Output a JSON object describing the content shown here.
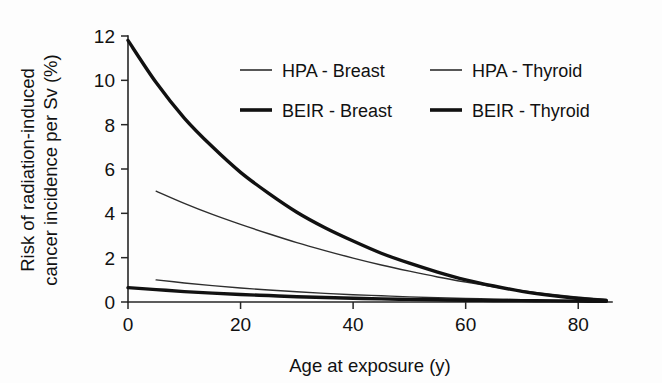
{
  "chart_data": {
    "type": "line",
    "title": "",
    "xlabel": "Age at exposure (y)",
    "ylabel": "Risk of radiation-induced cancer incidence per Sv (%)",
    "ylabel_line1": "Risk of radiation-induced",
    "ylabel_line2": "cancer incidence per Sv (%)",
    "xlim": [
      0,
      86
    ],
    "ylim": [
      0,
      12
    ],
    "xticks": [
      0,
      20,
      40,
      60,
      80
    ],
    "xtick_labels": [
      "0",
      "20",
      "40",
      "60",
      "80"
    ],
    "yticks": [
      0,
      2,
      4,
      6,
      8,
      10,
      12
    ],
    "ytick_labels": [
      "0",
      "2",
      "4",
      "6",
      "8",
      "10",
      "12"
    ],
    "grid": false,
    "legend_position": "upper-center",
    "x": [
      0,
      5,
      10,
      15,
      20,
      25,
      30,
      35,
      40,
      45,
      50,
      55,
      60,
      65,
      70,
      75,
      80,
      85
    ],
    "series": [
      {
        "name": "HPA - Breast",
        "line_width": "thin",
        "color": "#2e2e2e",
        "x": [
          5,
          10,
          15,
          20,
          25,
          30,
          35,
          40,
          45,
          50,
          55,
          60,
          65,
          70,
          75,
          80,
          85
        ],
        "values": [
          1.0,
          0.86,
          0.74,
          0.63,
          0.54,
          0.46,
          0.39,
          0.33,
          0.28,
          0.23,
          0.19,
          0.16,
          0.13,
          0.1,
          0.08,
          0.06,
          0.05
        ]
      },
      {
        "name": "HPA - Thyroid",
        "line_width": "thin",
        "color": "#2e2e2e",
        "x": [
          5,
          10,
          15,
          20,
          25,
          30,
          35,
          40,
          45,
          50,
          55,
          60,
          65,
          70,
          75,
          80,
          85
        ],
        "values": [
          5.0,
          4.45,
          3.95,
          3.5,
          3.08,
          2.68,
          2.32,
          1.98,
          1.67,
          1.39,
          1.13,
          0.9,
          0.69,
          0.51,
          0.35,
          0.22,
          0.12
        ]
      },
      {
        "name": "BEIR - Breast",
        "line_width": "thick",
        "color": "#111111",
        "x": [
          0,
          5,
          10,
          15,
          20,
          25,
          30,
          35,
          40,
          45,
          50,
          55,
          60,
          65,
          70,
          75,
          80,
          85
        ],
        "values": [
          0.65,
          0.56,
          0.47,
          0.4,
          0.34,
          0.29,
          0.24,
          0.2,
          0.17,
          0.14,
          0.12,
          0.1,
          0.08,
          0.07,
          0.06,
          0.05,
          0.04,
          0.03
        ]
      },
      {
        "name": "BEIR - Thyroid",
        "line_width": "thick",
        "color": "#111111",
        "x": [
          0,
          5,
          10,
          15,
          20,
          25,
          30,
          35,
          40,
          45,
          50,
          55,
          60,
          65,
          70,
          75,
          80,
          85
        ],
        "values": [
          11.8,
          9.9,
          8.3,
          7.0,
          5.85,
          4.9,
          4.05,
          3.35,
          2.75,
          2.2,
          1.75,
          1.35,
          1.0,
          0.72,
          0.48,
          0.3,
          0.16,
          0.07
        ]
      }
    ]
  },
  "legend": {
    "entries": [
      {
        "label": "HPA - Breast",
        "style": "thin"
      },
      {
        "label": "HPA - Thyroid",
        "style": "thin"
      },
      {
        "label": "BEIR - Breast",
        "style": "thick"
      },
      {
        "label": "BEIR - Thyroid",
        "style": "thick"
      }
    ]
  },
  "colors": {
    "background": "#fdfdfd",
    "axis": "#262626",
    "thin_line": "#2e2e2e",
    "thick_line": "#111111",
    "text": "#111111"
  }
}
